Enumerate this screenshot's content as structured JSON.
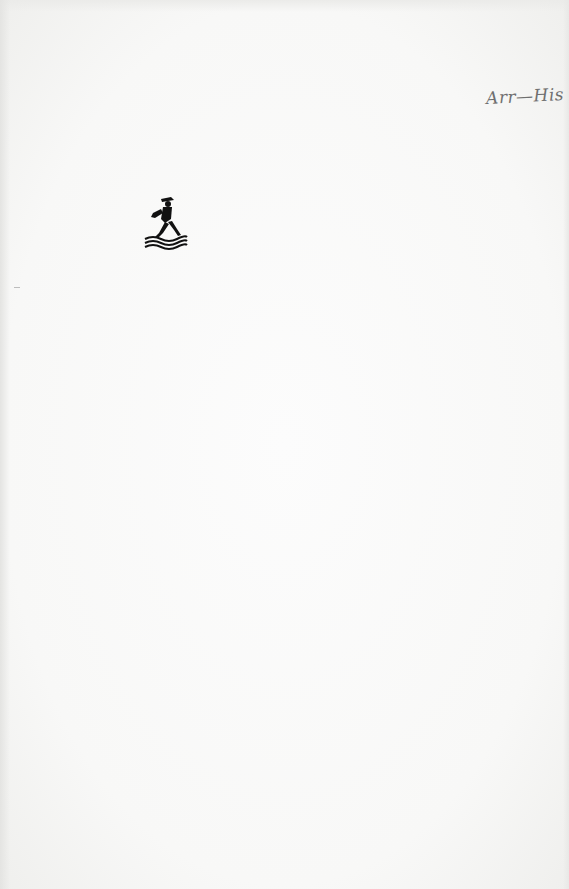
{
  "page": {
    "type": "book endpaper",
    "background_color": "#f7f7f6"
  },
  "handwritten_note": {
    "text": "Arr—His"
  },
  "colophon": {
    "icon": "publisher-logo-figure-walking-on-waves-icon",
    "color": "#111111"
  }
}
